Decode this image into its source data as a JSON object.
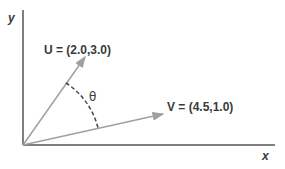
{
  "diagram": {
    "x_axis_label": "x",
    "y_axis_label": "y",
    "angle_label": "θ",
    "vectors": [
      {
        "name": "U",
        "label": "U = (2.0,3.0)",
        "x": 2.0,
        "y": 3.0
      },
      {
        "name": "V",
        "label": "V = (4.5,1.0)",
        "x": 4.5,
        "y": 1.0
      }
    ],
    "colors": {
      "axis": "#555555",
      "vector": "#a0a0a0",
      "arc": "#444444",
      "text": "#3a3a3a"
    }
  }
}
